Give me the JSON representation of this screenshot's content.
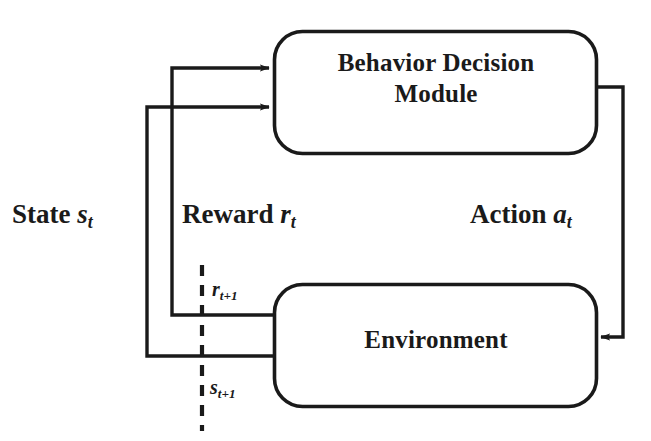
{
  "diagram": {
    "background_color": "#ffffff",
    "stroke_color": "#1a1a1a",
    "nodes": [
      {
        "id": "behavior-decision-module",
        "label_line1": "Behavior Decision",
        "label_line2": "Module",
        "shape": "rounded-rectangle",
        "x": 273,
        "y": 30,
        "width": 325,
        "height": 125
      },
      {
        "id": "environment",
        "label_line1": "Environment",
        "label_line2": "",
        "shape": "rounded-rectangle",
        "x": 273,
        "y": 283,
        "width": 325,
        "height": 125
      }
    ],
    "edges": [
      {
        "id": "reward-edge",
        "label_prefix": "Reward",
        "label_var": "r",
        "label_sub": "t",
        "from": "environment",
        "to": "behavior-decision-module",
        "arrowhead": "right"
      },
      {
        "id": "state-edge",
        "label_prefix": "State",
        "label_var": "s",
        "label_sub": "t",
        "from": "environment",
        "to": "behavior-decision-module",
        "arrowhead": "right"
      },
      {
        "id": "action-edge",
        "label_prefix": "Action",
        "label_var": "a",
        "label_sub": "t",
        "from": "behavior-decision-module",
        "to": "environment",
        "arrowhead": "left"
      }
    ],
    "annotations": [
      {
        "id": "reward-next",
        "var": "r",
        "sub": "t+1"
      },
      {
        "id": "state-next",
        "var": "s",
        "sub": "t+1"
      }
    ],
    "time_delimiter": {
      "id": "time-step-divider",
      "style": "dashed-vertical"
    }
  }
}
